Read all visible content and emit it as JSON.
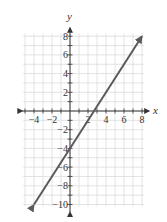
{
  "chart_data": {
    "type": "line",
    "title": "",
    "xlabel": "x",
    "ylabel": "y",
    "xlim": [
      -5,
      8
    ],
    "ylim": [
      -10,
      8
    ],
    "grid": true,
    "x_ticks": [
      -4,
      -2,
      2,
      4,
      6,
      8
    ],
    "x_tick_labels": [
      "−4",
      "−2",
      "2",
      "4",
      "6",
      "8"
    ],
    "y_ticks": [
      8,
      6,
      4,
      2,
      -2,
      -4,
      -6,
      -8,
      -10
    ],
    "y_tick_labels": [
      "8",
      "6",
      "4",
      "2",
      "−2",
      "−4",
      "−6",
      "−8",
      "−10"
    ],
    "series": [
      {
        "name": "y = (3/2)x − 4",
        "slope": 1.5,
        "intercept": -4,
        "x": [
          -4,
          8
        ],
        "y": [
          -10,
          8
        ],
        "arrows_both_ends": true,
        "color": "#555555"
      }
    ]
  },
  "colors": {
    "grid": "#dcdcdc",
    "axis": "#333333",
    "line": "#5a5a5a"
  }
}
